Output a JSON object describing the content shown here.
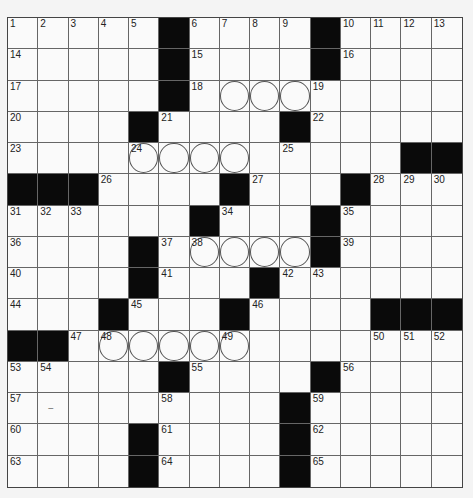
{
  "puzzle": {
    "size": 15,
    "rows": [
      "#....#....#....",
      "#....#.#...#....",
      "x"
    ],
    "black": [
      [
        0,
        5
      ],
      [
        0,
        10
      ],
      [
        1,
        5
      ],
      [
        1,
        10
      ],
      [
        2,
        5
      ],
      [
        3,
        4
      ],
      [
        3,
        9
      ],
      [
        4,
        13
      ],
      [
        4,
        14
      ],
      [
        5,
        0
      ],
      [
        5,
        1
      ],
      [
        5,
        2
      ],
      [
        5,
        7
      ],
      [
        5,
        11
      ],
      [
        6,
        6
      ],
      [
        6,
        10
      ],
      [
        7,
        4
      ],
      [
        7,
        10
      ],
      [
        8,
        4
      ],
      [
        8,
        8
      ],
      [
        9,
        3
      ],
      [
        9,
        7
      ],
      [
        9,
        12
      ],
      [
        9,
        13
      ],
      [
        9,
        14
      ],
      [
        10,
        0
      ],
      [
        10,
        1
      ],
      [
        11,
        5
      ],
      [
        11,
        10
      ],
      [
        12,
        9
      ],
      [
        13,
        4
      ],
      [
        13,
        9
      ],
      [
        14,
        4
      ],
      [
        14,
        9
      ]
    ],
    "circles": [
      [
        2,
        7
      ],
      [
        2,
        8
      ],
      [
        2,
        9
      ],
      [
        4,
        4
      ],
      [
        4,
        5
      ],
      [
        4,
        6
      ],
      [
        4,
        7
      ],
      [
        7,
        6
      ],
      [
        7,
        7
      ],
      [
        7,
        8
      ],
      [
        7,
        9
      ],
      [
        10,
        3
      ],
      [
        10,
        4
      ],
      [
        10,
        5
      ],
      [
        10,
        6
      ],
      [
        10,
        7
      ]
    ],
    "numbers": [
      [
        0,
        0,
        "1"
      ],
      [
        0,
        1,
        "2"
      ],
      [
        0,
        2,
        "3"
      ],
      [
        0,
        3,
        "4"
      ],
      [
        0,
        4,
        "5"
      ],
      [
        0,
        6,
        "6"
      ],
      [
        0,
        7,
        "7"
      ],
      [
        0,
        8,
        "8"
      ],
      [
        0,
        9,
        "9"
      ],
      [
        0,
        11,
        "10"
      ],
      [
        0,
        12,
        "11"
      ],
      [
        0,
        13,
        "12"
      ],
      [
        0,
        14,
        "13"
      ],
      [
        1,
        0,
        "14"
      ],
      [
        1,
        6,
        "15"
      ],
      [
        1,
        11,
        "16"
      ],
      [
        2,
        0,
        "17"
      ],
      [
        2,
        6,
        "18"
      ],
      [
        2,
        10,
        "19"
      ],
      [
        3,
        0,
        "20"
      ],
      [
        3,
        5,
        "21"
      ],
      [
        3,
        10,
        "22"
      ],
      [
        4,
        0,
        "23"
      ],
      [
        4,
        4,
        "24"
      ],
      [
        4,
        9,
        "25"
      ],
      [
        5,
        3,
        "26"
      ],
      [
        5,
        8,
        "27"
      ],
      [
        5,
        12,
        "28"
      ],
      [
        5,
        13,
        "29"
      ],
      [
        5,
        14,
        "30"
      ],
      [
        6,
        0,
        "31"
      ],
      [
        6,
        1,
        "32"
      ],
      [
        6,
        2,
        "33"
      ],
      [
        6,
        7,
        "34"
      ],
      [
        6,
        11,
        "35"
      ],
      [
        7,
        0,
        "36"
      ],
      [
        7,
        5,
        "37"
      ],
      [
        7,
        6,
        "38"
      ],
      [
        7,
        11,
        "39"
      ],
      [
        8,
        0,
        "40"
      ],
      [
        8,
        5,
        "41"
      ],
      [
        8,
        9,
        "42"
      ],
      [
        8,
        10,
        "43"
      ],
      [
        9,
        0,
        "44"
      ],
      [
        9,
        4,
        "45"
      ],
      [
        9,
        8,
        "46"
      ],
      [
        10,
        2,
        "47"
      ],
      [
        10,
        3,
        "48"
      ],
      [
        10,
        7,
        "49"
      ],
      [
        10,
        12,
        "50"
      ],
      [
        10,
        13,
        "51"
      ],
      [
        10,
        14,
        "52"
      ],
      [
        11,
        0,
        "53"
      ],
      [
        11,
        1,
        "54"
      ],
      [
        11,
        6,
        "55"
      ],
      [
        11,
        11,
        "56"
      ],
      [
        12,
        0,
        "57"
      ],
      [
        12,
        5,
        "58"
      ],
      [
        12,
        10,
        "59"
      ],
      [
        13,
        0,
        "60"
      ],
      [
        13,
        5,
        "61"
      ],
      [
        13,
        10,
        "62"
      ],
      [
        14,
        0,
        "63"
      ],
      [
        14,
        5,
        "64"
      ],
      [
        14,
        10,
        "65"
      ]
    ],
    "marks": [
      [
        12,
        1,
        "–"
      ]
    ]
  }
}
